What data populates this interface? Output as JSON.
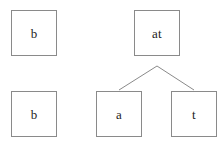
{
  "diagram": {
    "canvas": {
      "width": 221,
      "height": 142,
      "background": "#ffffff"
    },
    "style": {
      "box_border_color": "#8a8a8a",
      "box_fill_color": "#ffffff",
      "edge_color": "#8a8a8a",
      "text_color": "#1d1d1d",
      "box_size": 46,
      "border_width": 1,
      "font_size": 13
    },
    "nodes": [
      {
        "id": "stack-top",
        "label": "b",
        "x": 11,
        "y": 10
      },
      {
        "id": "stack-bottom",
        "label": "b",
        "x": 11,
        "y": 91
      },
      {
        "id": "parent-at",
        "label": "at",
        "x": 134,
        "y": 10
      },
      {
        "id": "child-a",
        "label": "a",
        "x": 96,
        "y": 91
      },
      {
        "id": "child-t",
        "label": "t",
        "x": 171,
        "y": 91
      }
    ],
    "edges": [
      {
        "id": "edge-at-a",
        "from": "parent-at",
        "to": "child-a",
        "x1": 157,
        "y1": 66,
        "x2": 119,
        "y2": 90
      },
      {
        "id": "edge-at-t",
        "from": "parent-at",
        "to": "child-t",
        "x1": 157,
        "y1": 66,
        "x2": 194,
        "y2": 90
      }
    ]
  }
}
